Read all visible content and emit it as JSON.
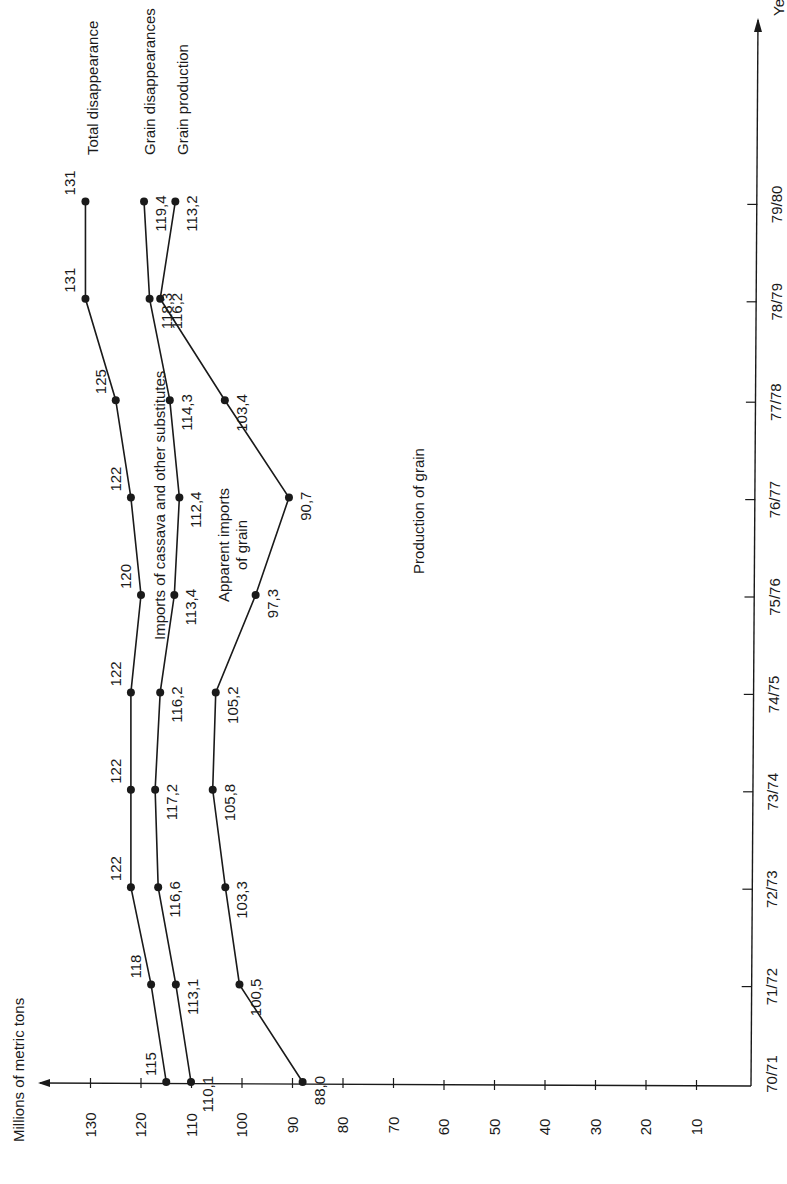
{
  "chart_data": {
    "type": "line",
    "orientation": "rotated-90-ccw",
    "title": "",
    "xlabel": "Year",
    "ylabel": "Millions of metric tons",
    "categories": [
      "70/71",
      "71/72",
      "72/73",
      "73/74",
      "74/75",
      "75/76",
      "76/77",
      "77/78",
      "78/79",
      "79/80"
    ],
    "y_ticks": [
      10,
      20,
      30,
      40,
      50,
      60,
      70,
      80,
      90,
      100,
      110,
      120,
      130
    ],
    "ylim": [
      0,
      135
    ],
    "grid": false,
    "series": [
      {
        "name": "Total disappearance",
        "values": [
          115,
          118,
          122,
          122,
          122,
          120,
          122,
          125,
          131,
          131
        ],
        "value_labels": [
          "115",
          "118",
          "122",
          "122",
          "122",
          "120",
          "122",
          "125",
          "131",
          "131"
        ]
      },
      {
        "name": "Grain disappearances",
        "values": [
          110.1,
          113.1,
          116.6,
          117.2,
          116.2,
          113.4,
          112.4,
          114.3,
          118.3,
          119.4
        ],
        "value_labels": [
          "110,1",
          "113,1",
          "116,6",
          "117,2",
          "116,2",
          "113,4",
          "112,4",
          "114,3",
          "118,3",
          "119,4"
        ]
      },
      {
        "name": "Grain production",
        "values": [
          88.0,
          100.5,
          103.3,
          105.8,
          105.2,
          97.3,
          90.7,
          103.4,
          116.2,
          113.2
        ],
        "value_labels": [
          "88,0",
          "100,5",
          "103,3",
          "105,8",
          "105,2",
          "97,3",
          "90,7",
          "103,4",
          "116,2",
          "113,2"
        ]
      }
    ],
    "annotations": [
      "Imports of cassava and other substitutes",
      "Apparent imports of grain",
      "Production of grain"
    ],
    "legend_position": "end-of-lines (top)"
  },
  "axes": {
    "value_axis_title": "Millions of metric tons",
    "year_axis_title": "Ye",
    "value_ticks": [
      "130",
      "120",
      "110",
      "100",
      "90",
      "80",
      "70",
      "60",
      "50",
      "40",
      "30",
      "20",
      "10"
    ],
    "year_ticks": [
      "70/71",
      "71/72",
      "72/73",
      "73/74",
      "74/75",
      "75/76",
      "76/77",
      "77/78",
      "78/79",
      "79/80"
    ]
  },
  "labels": {
    "series_end": [
      "Total disappearance",
      "Grain disappearances",
      "Grain production"
    ],
    "region_imports_cassava": "Imports of cassava and other substitutes",
    "region_apparent_imports_line1": "Apparent imports",
    "region_apparent_imports_line2": "of grain",
    "region_production": "Production of grain"
  },
  "colors": {
    "ink": "#1a1a1a",
    "background": "#ffffff"
  }
}
